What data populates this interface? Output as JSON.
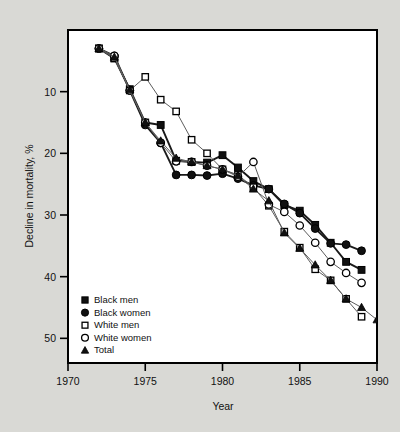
{
  "chart_data": {
    "type": "line",
    "title": "",
    "xlabel": "Year",
    "ylabel": "Decline in mortality, %",
    "xlim": [
      1970,
      1990
    ],
    "ylim": [
      0,
      54
    ],
    "y_inverted": true,
    "grid": false,
    "legend_position": "bottom-left",
    "xticks": [
      1970,
      1975,
      1980,
      1985,
      1990
    ],
    "yticks": [
      10,
      20,
      30,
      40,
      50
    ],
    "x": [
      1972,
      1973,
      1974,
      1975,
      1976,
      1977,
      1978,
      1979,
      1980,
      1981,
      1982,
      1983,
      1984,
      1985,
      1986,
      1987,
      1988,
      1989,
      1990
    ],
    "series": [
      {
        "name": "Black men",
        "marker": "filled-square",
        "values": [
          3.0,
          4.6,
          9.6,
          15.0,
          15.4,
          21.2,
          21.4,
          21.5,
          20.3,
          22.3,
          24.5,
          25.8,
          28.4,
          29.3,
          31.6,
          34.5,
          37.6,
          38.9,
          null
        ]
      },
      {
        "name": "Black women",
        "marker": "filled-circle",
        "values": [
          3.0,
          4.2,
          9.8,
          15.4,
          18.3,
          23.5,
          23.5,
          23.6,
          23.3,
          24.1,
          25.2,
          25.8,
          28.2,
          29.7,
          32.2,
          34.6,
          34.8,
          35.8,
          null
        ]
      },
      {
        "name": "White men",
        "marker": "open-square",
        "values": [
          3.0,
          4.6,
          9.8,
          7.6,
          11.3,
          13.2,
          17.8,
          20.0,
          22.6,
          23.5,
          25.5,
          28.5,
          32.7,
          35.3,
          38.8,
          40.6,
          43.6,
          46.5,
          null
        ]
      },
      {
        "name": "White women",
        "marker": "open-circle",
        "values": [
          3.0,
          4.2,
          9.8,
          15.0,
          18.3,
          21.3,
          21.4,
          22.0,
          22.6,
          23.8,
          21.4,
          28.3,
          29.5,
          31.7,
          34.5,
          37.6,
          39.4,
          41.0,
          null
        ]
      },
      {
        "name": "Total",
        "marker": "filled-triangle",
        "values": [
          3.0,
          4.4,
          9.7,
          15.0,
          18.0,
          20.8,
          21.4,
          22.0,
          22.6,
          23.6,
          25.8,
          27.7,
          32.9,
          35.4,
          38.1,
          40.6,
          43.6,
          45.0,
          47.0
        ]
      }
    ]
  },
  "legend": {
    "items": [
      {
        "label": "Black men",
        "marker": "filled-square"
      },
      {
        "label": "Black women",
        "marker": "filled-circle"
      },
      {
        "label": "White men",
        "marker": "open-square"
      },
      {
        "label": "White women",
        "marker": "open-circle"
      },
      {
        "label": "Total",
        "marker": "filled-triangle"
      }
    ]
  },
  "colors": {
    "background": "#d9d9d5",
    "plot_background": "#ffffff",
    "axis": "#000000",
    "line": "#4a4a4a",
    "marker_fill": "#111111",
    "marker_stroke": "#000000"
  }
}
